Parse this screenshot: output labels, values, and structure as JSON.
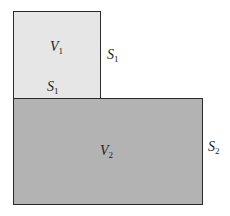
{
  "diagram": {
    "small_box": {
      "fill": "#e6e6e6",
      "volume_label": {
        "symbol": "V",
        "sub": "1"
      },
      "bottom_label": {
        "symbol": "S",
        "sub": "1"
      },
      "side_label": {
        "symbol": "S",
        "sub": "1"
      }
    },
    "big_box": {
      "fill": "#b3b3b3",
      "volume_label": {
        "symbol": "V",
        "sub": "2"
      },
      "side_label": {
        "symbol": "S",
        "sub": "2"
      }
    }
  }
}
